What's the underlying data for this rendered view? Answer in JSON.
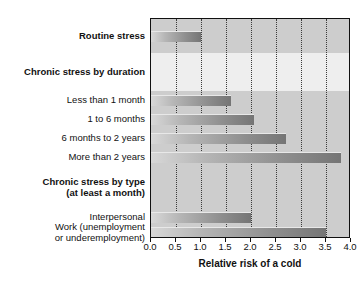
{
  "chart_data": {
    "type": "bar",
    "orientation": "horizontal",
    "title": "",
    "xlabel": "Relative risk of a cold",
    "ylabel": "",
    "xlim": [
      0.0,
      4.0
    ],
    "xticks": [
      "0.0",
      "0.5",
      "1.0",
      "1.5",
      "2.0",
      "2.5",
      "3.0",
      "3.5",
      "4.0"
    ],
    "xtick_values": [
      0.0,
      0.5,
      1.0,
      1.5,
      2.0,
      2.5,
      3.0,
      3.5,
      4.0
    ],
    "grid": "vertical dotted gridlines at each 0.5 tick",
    "legend": "none",
    "rows": [
      {
        "label": "Routine stress",
        "type": "bar",
        "header": true,
        "value": 1.0
      },
      {
        "label": "Chronic stress by duration",
        "type": "header",
        "header": true,
        "value": null
      },
      {
        "label": "Less than 1 month",
        "type": "bar",
        "header": false,
        "value": 1.6
      },
      {
        "label": "1 to 6 months",
        "type": "bar",
        "header": false,
        "value": 2.05
      },
      {
        "label": "6 months to 2 years",
        "type": "bar",
        "header": false,
        "value": 2.7
      },
      {
        "label": "More than 2 years",
        "type": "bar",
        "header": false,
        "value": 3.8
      },
      {
        "label": "Chronic stress by type\n(at least a month)",
        "type": "header",
        "header": true,
        "value": null
      },
      {
        "label": "Interpersonal",
        "type": "bar",
        "header": false,
        "value": 2.0
      },
      {
        "label": "Work (unemployment\nor underemployment)",
        "type": "bar",
        "header": false,
        "value": 3.5
      }
    ],
    "categories": [
      "Routine stress",
      "Less than 1 month",
      "1 to 6 months",
      "6 months to 2 years",
      "More than 2 years",
      "Interpersonal",
      "Work (unemployment or underemployment)"
    ],
    "values": [
      1.0,
      1.6,
      2.05,
      2.7,
      3.8,
      2.0,
      3.5
    ],
    "colors": {
      "bar_light": "#d8d8d8",
      "bar_dark": "#757575",
      "plot_background": "#e3e3e3",
      "band_dark": "#cdcdcd",
      "band_light": "#eeeeee",
      "axis": "#111111",
      "gridline": "#3b3b3b"
    }
  }
}
